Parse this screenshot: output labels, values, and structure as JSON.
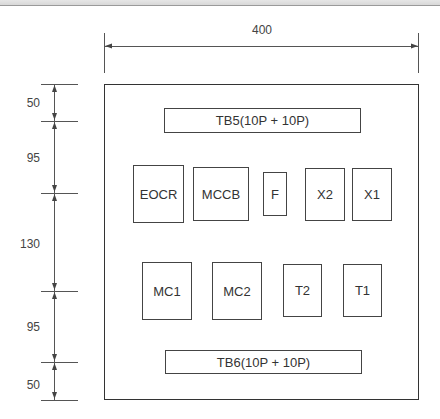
{
  "diagram": {
    "type": "panel-layout-drawing",
    "width_dimension": "400",
    "height_dimensions": [
      {
        "label": "50",
        "from_y": 84,
        "to_y": 121
      },
      {
        "label": "95",
        "from_y": 121,
        "to_y": 193
      },
      {
        "label": "130",
        "from_y": 193,
        "to_y": 291
      },
      {
        "label": "95",
        "from_y": 291,
        "to_y": 362
      },
      {
        "label": "50",
        "from_y": 362,
        "to_y": 400
      }
    ],
    "terminal_blocks": {
      "top": "TB5(10P + 10P)",
      "bottom": "TB6(10P + 10P)"
    },
    "row1_components": [
      "EOCR",
      "MCCB",
      "F",
      "X2",
      "X1"
    ],
    "row2_components": [
      "MC1",
      "MC2",
      "T2",
      "T1"
    ]
  },
  "colors": {
    "line": "#444444",
    "text": "#333333",
    "background": "#ffffff"
  }
}
